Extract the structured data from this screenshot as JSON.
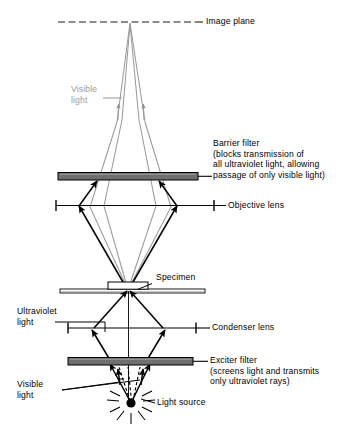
{
  "figure": {
    "background_color": "#ffffff",
    "visible_light_color": "#9a9a9a",
    "uv_light_color": "#000000",
    "filter_fill_color": "#808080",
    "stroke_color": "#000000"
  },
  "labels": {
    "image_plane": "Image plane",
    "visible_light_top": "Visible\nlight",
    "barrier_filter": "Barrier filter\n(blocks transmission of\nall ultraviolet light, allowing\npassage of only visible light)",
    "objective_lens": "Objective lens",
    "specimen": "Specimen",
    "ultraviolet_light": "Ultraviolet\nlight",
    "condenser_lens": "Condenser lens",
    "exciter_filter": "Exciter filter\n(screens light and transmits\nonly ultraviolet rays)",
    "visible_light_bottom": "Visible\nlight",
    "light_source": "Light source"
  },
  "components": [
    {
      "name": "image-plane",
      "label": "Image plane",
      "kind": "dashed-line",
      "y": 22
    },
    {
      "name": "barrier-filter",
      "label": "Barrier filter",
      "kind": "filter-bar",
      "y": 176
    },
    {
      "name": "objective-lens",
      "label": "Objective lens",
      "kind": "lens-line",
      "y": 205
    },
    {
      "name": "specimen-slide",
      "label": "Specimen",
      "kind": "slide",
      "y": 291
    },
    {
      "name": "condenser-lens",
      "label": "Condenser lens",
      "kind": "lens-line",
      "y": 328
    },
    {
      "name": "exciter-filter",
      "label": "Exciter filter",
      "kind": "filter-bar",
      "y": 361
    },
    {
      "name": "light-source",
      "label": "Light source",
      "kind": "point-source",
      "y": 403
    }
  ],
  "ray_paths": {
    "visible_light_upper": "from specimen through objective lens and barrier filter converging at image plane",
    "ultraviolet_light_lower": "from light source through exciter filter and condenser lens converging at specimen",
    "visible_light_blocked": "stray visible rays deflected at the exciter filter"
  }
}
